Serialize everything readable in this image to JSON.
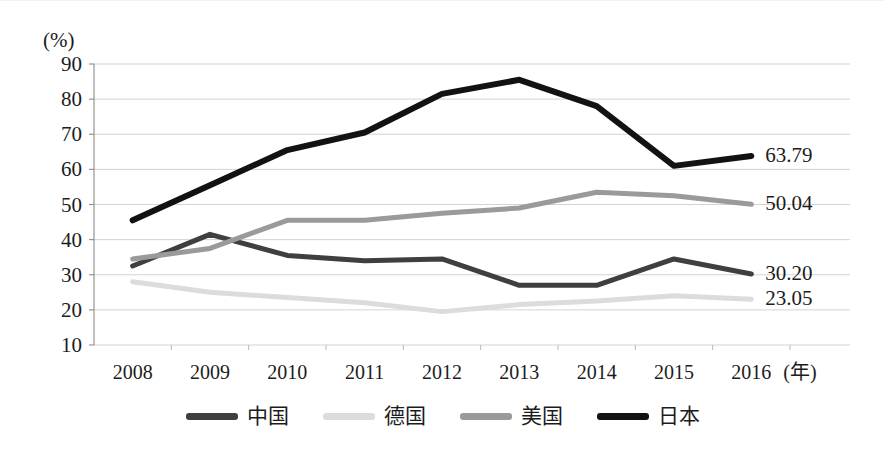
{
  "axis": {
    "unit_label": "(%)",
    "x_unit_label": "(年)",
    "y_ticks": [
      "90",
      "80",
      "70",
      "60",
      "50",
      "40",
      "30",
      "20",
      "10"
    ],
    "x_ticks": [
      "2008",
      "2009",
      "2010",
      "2011",
      "2012",
      "2013",
      "2014",
      "2015",
      "2016"
    ]
  },
  "end_labels": [
    {
      "text": "63.79",
      "series": "日本"
    },
    {
      "text": "50.04",
      "series": "美国"
    },
    {
      "text": "30.20",
      "series": "中国"
    },
    {
      "text": "23.05",
      "series": "德国"
    }
  ],
  "legend": {
    "items": [
      {
        "label": "中国",
        "color": "#3f3f3f"
      },
      {
        "label": "德国",
        "color": "#dcdcdc"
      },
      {
        "label": "美国",
        "color": "#9a9a9a"
      },
      {
        "label": "日本",
        "color": "#121212"
      }
    ]
  },
  "chart_data": {
    "type": "line",
    "title": "",
    "xlabel": "(年)",
    "ylabel": "(%)",
    "ylim": [
      10,
      90
    ],
    "ytick_step": 10,
    "grid": true,
    "legend_position": "bottom",
    "categories": [
      "2008",
      "2009",
      "2010",
      "2011",
      "2012",
      "2013",
      "2014",
      "2015",
      "2016"
    ],
    "series": [
      {
        "name": "中国",
        "color": "#3f3f3f",
        "linewidth": 5,
        "end_label": "30.20",
        "values": [
          32.5,
          41.5,
          35.5,
          34.0,
          34.5,
          27.0,
          27.0,
          34.5,
          30.2
        ]
      },
      {
        "name": "德国",
        "color": "#dcdcdc",
        "linewidth": 5,
        "end_label": "23.05",
        "values": [
          28.0,
          25.0,
          23.5,
          22.0,
          19.5,
          21.5,
          22.5,
          24.0,
          23.05
        ]
      },
      {
        "name": "美国",
        "color": "#9a9a9a",
        "linewidth": 5,
        "end_label": "50.04",
        "values": [
          34.5,
          37.5,
          45.5,
          45.5,
          47.5,
          49.0,
          53.5,
          52.5,
          50.04
        ]
      },
      {
        "name": "日本",
        "color": "#121212",
        "linewidth": 6,
        "end_label": "63.79",
        "values": [
          45.5,
          55.5,
          65.5,
          70.5,
          81.5,
          85.5,
          78.0,
          61.0,
          63.79
        ]
      }
    ]
  }
}
